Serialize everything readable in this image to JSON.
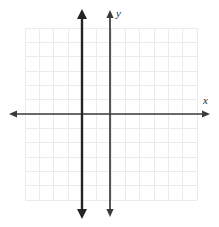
{
  "figure": {
    "kind": "coordinate-plane",
    "background_color": "#ffffff"
  },
  "labels": {
    "y_axis": "y",
    "x_axis": "x"
  },
  "colors": {
    "grid": "#ebebeb",
    "axis": "#3a3a3a",
    "graph_line": "#242424",
    "label": "#2a2a2a"
  },
  "chart_data": {
    "type": "line",
    "title": "",
    "xlabel": "x",
    "ylabel": "y",
    "grid": {
      "cols": 12,
      "rows": 12,
      "cell_px": 14.3,
      "left_px": 25,
      "top_px": 28,
      "right_px": 197,
      "bottom_px": 200
    },
    "legend": "none",
    "xlim": [
      -6,
      6
    ],
    "ylim": [
      -6,
      6
    ],
    "grid_step": 1,
    "axes": {
      "x_axis": {
        "pixel_y": 114,
        "pixel_x_start": 10,
        "pixel_x_end": 209,
        "arrows": "both",
        "value": 0
      },
      "y_axis": {
        "pixel_x": 110,
        "pixel_y_start": 11,
        "pixel_y_end": 216,
        "arrows": "both",
        "value": 0
      }
    },
    "series": [
      {
        "name": "vertical line",
        "equation": "x = -2",
        "type": "vertical-line",
        "x": -2,
        "pixel_x": 82,
        "pixel_y_start": 9,
        "pixel_y_end": 219,
        "arrows": "both",
        "color": "#242424",
        "width_px": 2.4
      }
    ],
    "annotations": []
  }
}
